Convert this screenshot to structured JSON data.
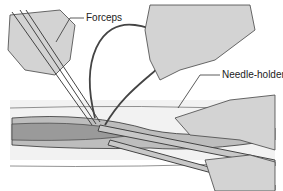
{
  "illustration": {
    "subject": "Suturing a wound with forceps and needle-holder",
    "labels": {
      "forceps": "Forceps",
      "needle_holder": "Needle-holder"
    },
    "colors": {
      "skin_fill": "#d3d3d3",
      "wound_fill": "#a9a9a9",
      "line": "#333333",
      "suture": "#555555",
      "background": "#ffffff"
    }
  }
}
